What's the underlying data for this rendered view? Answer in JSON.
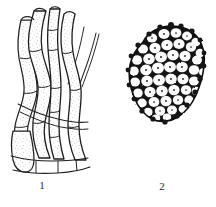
{
  "plate": {
    "background_color": "#ffffff",
    "ink_color": "#1a1a1a",
    "stipple_color": "#5a5a5a",
    "figure_count": 2
  },
  "figures": [
    {
      "number": "1",
      "caption": "1",
      "subject": "elongated septate filaments",
      "description": "Cluster of long, slender, curving septate hyphae or fibre cells shown in longitudinal view with cross-walls and faint internal stippling.",
      "orientation": "vertical",
      "element_count": 9,
      "shading": "light stipple"
    },
    {
      "number": "2",
      "caption": "2",
      "subject": "cellular tissue section",
      "description": "Irregular rounded patch of tightly packed isodiametric cells with heavily inked cell walls, each cell bearing a small central granule.",
      "orientation": "surface view",
      "cell_count": 58,
      "shading": "dense black cell walls"
    }
  ]
}
